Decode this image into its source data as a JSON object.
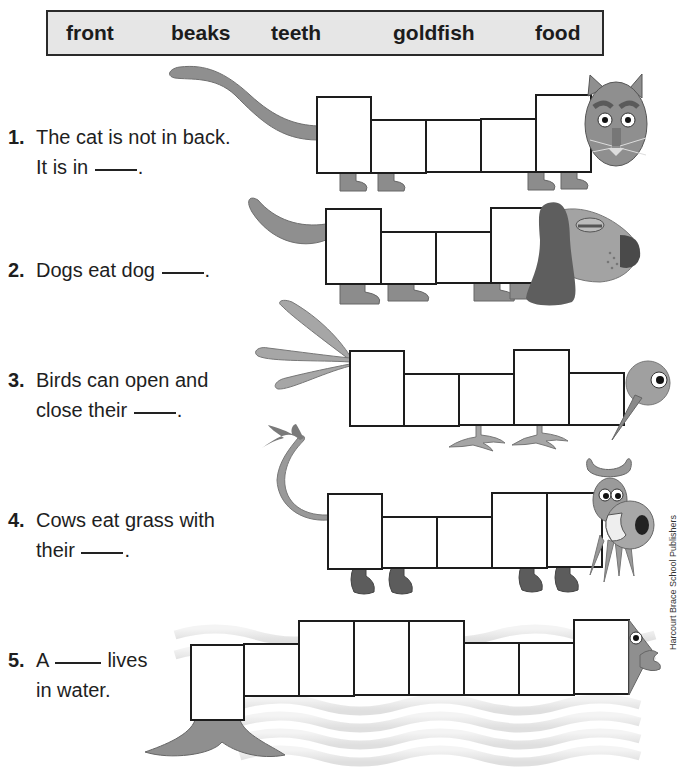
{
  "word_bank": {
    "words": [
      "front",
      "beaks",
      "teeth",
      "goldfish",
      "food"
    ]
  },
  "questions": [
    {
      "number": "1.",
      "line1": "The cat is not in back.",
      "line2_before": "It is in",
      "line2_after": ".",
      "animal": "cat",
      "boxes": 6
    },
    {
      "number": "2.",
      "line1_before": "Dogs eat dog",
      "line1_after": ".",
      "animal": "dog",
      "boxes": 4
    },
    {
      "number": "3.",
      "line1": "Birds can open and",
      "line2_before": "close their",
      "line2_after": ".",
      "animal": "bird",
      "boxes": 5
    },
    {
      "number": "4.",
      "line1": "Cows eat grass with",
      "line2_before": "their",
      "line2_after": ".",
      "animal": "cow",
      "boxes": 5
    },
    {
      "number": "5.",
      "line1_before": "A",
      "line1_after": "lives",
      "line2": "in water.",
      "animal": "fish",
      "boxes": 8
    }
  ],
  "credit": "Harcourt Brace School Publishers",
  "colors": {
    "animal_gray": "#8f8f8f",
    "dark_gray": "#5e5e5e",
    "box_border": "#1d1d1d",
    "wordbank_bg": "#e6e6e6"
  }
}
